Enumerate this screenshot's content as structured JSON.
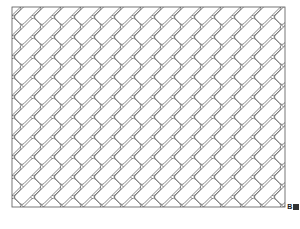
{
  "document": {
    "kind": "line-drawing",
    "subject": "herringbone brick paving pattern",
    "background_color": "#ffffff"
  },
  "frame": {
    "x": 12,
    "y": 7,
    "width": 273,
    "height": 200,
    "stroke_color": "#555555",
    "stroke_width": 0.8,
    "fill_color": "#ffffff"
  },
  "pattern": {
    "name": "herringbone",
    "brick": {
      "length": 28,
      "width": 12,
      "corner_radius": 2.6,
      "stroke_color": "#5a5a5a",
      "stroke_width": 0.7,
      "fill_color": "#ffffff",
      "angles_deg": [
        45,
        -45
      ]
    },
    "tile_period": 20,
    "joint_gap": 1.4,
    "columns": 21,
    "rows": 16
  },
  "corner_label": {
    "text": "B",
    "block_color": "#333333"
  }
}
